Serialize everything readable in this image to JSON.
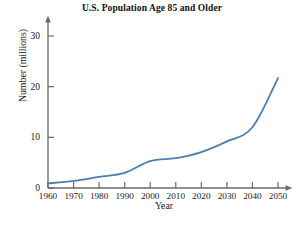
{
  "figure": {
    "title": "U.S. Population Age 85 and Older",
    "background_color": "#ffffff",
    "axis_color": "#6b6b6b",
    "text_color": "#1a1a1a"
  },
  "chart_data": {
    "type": "line",
    "title": "U.S. Population Age 85 and Older",
    "xlabel": "Year",
    "ylabel": "Number (millions)",
    "x": [
      1960,
      1970,
      1980,
      1990,
      2000,
      2010,
      2020,
      2030,
      2040,
      2050
    ],
    "values": [
      0.9,
      1.4,
      2.2,
      3.0,
      5.3,
      5.9,
      7.1,
      9.2,
      12.0,
      21.7
    ],
    "series": [
      {
        "name": "U.S. population age 85 and older",
        "color": "#4a7fb5",
        "values": [
          0.9,
          1.4,
          2.2,
          3.0,
          5.3,
          5.9,
          7.1,
          9.2,
          12.0,
          21.7
        ]
      }
    ],
    "categories": [
      "1960",
      "1970",
      "1980",
      "1990",
      "2000",
      "2010",
      "2020",
      "2030",
      "2040",
      "2050"
    ],
    "xlim": [
      1960,
      2050
    ],
    "ylim": [
      0,
      33
    ],
    "xticks": [
      1960,
      1970,
      1980,
      1990,
      2000,
      2010,
      2020,
      2030,
      2040,
      2050
    ],
    "xtick_labels": [
      "1960",
      "1970",
      "1980",
      "1990",
      "2000",
      "2010",
      "2020",
      "2030",
      "2040",
      "2050"
    ],
    "yticks": [
      0,
      10,
      20,
      30
    ],
    "ytick_labels": [
      "0",
      "10",
      "20",
      "30"
    ],
    "grid": false,
    "legend": false,
    "legend_position": "none",
    "line_color": "#4a7fb5",
    "line_width": 1.8,
    "axis_arrows": true
  }
}
